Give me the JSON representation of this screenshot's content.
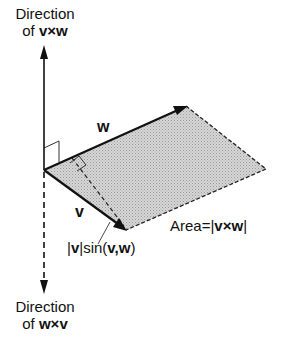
{
  "top_label": {
    "line1": "Direction",
    "line2_prefix": "of ",
    "line2_expr": "v×w"
  },
  "bottom_label": {
    "line1": "Direction",
    "line2_prefix": "of ",
    "line2_expr": "w×v"
  },
  "vector_w": "w",
  "vector_v": "v",
  "area_label": {
    "prefix": "Area=|",
    "expr": "v×w",
    "suffix": "|"
  },
  "height_label": {
    "p1": "|",
    "v": "v",
    "p2": "|sin(",
    "args": "v,w",
    "p3": ")"
  },
  "colors": {
    "ink": "#111111",
    "fill": "#c8c8c8"
  }
}
